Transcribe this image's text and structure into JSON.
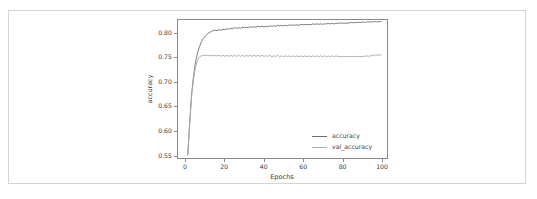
{
  "figure": {
    "background_color": "#ffffff",
    "frame_color": "#d4d4d4",
    "axes_color": "#8a8a8a",
    "text_color": "#3d3d3d"
  },
  "chart_data": {
    "type": "line",
    "title": "",
    "xlabel": "Epochs",
    "ylabel": "accuracy",
    "xlim": [
      -4,
      103
    ],
    "ylim": [
      0.543,
      0.828
    ],
    "grid": false,
    "legend_position": "lower right",
    "xticks": [
      0,
      20,
      40,
      60,
      80,
      100
    ],
    "xtick_labels": [
      "0",
      "20",
      "40",
      "60",
      "80",
      "100"
    ],
    "yticks": [
      0.55,
      0.6,
      0.65,
      0.7,
      0.75,
      0.8
    ],
    "ytick_labels": [
      "0.55",
      "0.60",
      "0.65",
      "0.70",
      "0.75",
      "0.80"
    ],
    "x": [
      1,
      2,
      3,
      4,
      5,
      6,
      7,
      8,
      9,
      10,
      11,
      12,
      13,
      14,
      15,
      16,
      17,
      18,
      19,
      20,
      21,
      22,
      23,
      24,
      25,
      26,
      27,
      28,
      29,
      30,
      31,
      32,
      33,
      34,
      35,
      36,
      37,
      38,
      39,
      40,
      41,
      42,
      43,
      44,
      45,
      46,
      47,
      48,
      49,
      50,
      51,
      52,
      53,
      54,
      55,
      56,
      57,
      58,
      59,
      60,
      61,
      62,
      63,
      64,
      65,
      66,
      67,
      68,
      69,
      70,
      71,
      72,
      73,
      74,
      75,
      76,
      77,
      78,
      79,
      80,
      81,
      82,
      83,
      84,
      85,
      86,
      87,
      88,
      89,
      90,
      91,
      92,
      93,
      94,
      95,
      96,
      97,
      98,
      99,
      100
    ],
    "series": [
      {
        "name": "accuracy",
        "color": "#6e6e6e",
        "values": [
          0.549,
          0.616,
          0.676,
          0.714,
          0.742,
          0.76,
          0.773,
          0.783,
          0.79,
          0.795,
          0.799,
          0.802,
          0.804,
          0.806,
          0.807,
          0.806,
          0.808,
          0.807,
          0.809,
          0.808,
          0.81,
          0.809,
          0.811,
          0.81,
          0.812,
          0.811,
          0.812,
          0.811,
          0.813,
          0.812,
          0.813,
          0.812,
          0.814,
          0.813,
          0.814,
          0.813,
          0.815,
          0.814,
          0.815,
          0.814,
          0.815,
          0.814,
          0.816,
          0.815,
          0.816,
          0.815,
          0.817,
          0.816,
          0.817,
          0.816,
          0.817,
          0.816,
          0.818,
          0.817,
          0.818,
          0.817,
          0.818,
          0.817,
          0.819,
          0.818,
          0.819,
          0.818,
          0.819,
          0.818,
          0.82,
          0.819,
          0.82,
          0.819,
          0.82,
          0.819,
          0.82,
          0.82,
          0.821,
          0.82,
          0.821,
          0.82,
          0.821,
          0.821,
          0.822,
          0.821,
          0.822,
          0.821,
          0.822,
          0.822,
          0.823,
          0.822,
          0.823,
          0.823,
          0.823,
          0.823,
          0.824,
          0.823,
          0.824,
          0.824,
          0.824,
          0.824,
          0.825,
          0.824,
          0.825,
          0.825
        ]
      },
      {
        "name": "val_accuracy",
        "color": "#a8a8a8",
        "values": [
          0.551,
          0.614,
          0.672,
          0.708,
          0.732,
          0.745,
          0.752,
          0.754,
          0.755,
          0.755,
          0.755,
          0.754,
          0.755,
          0.754,
          0.755,
          0.754,
          0.755,
          0.753,
          0.755,
          0.753,
          0.755,
          0.753,
          0.755,
          0.753,
          0.755,
          0.753,
          0.755,
          0.753,
          0.755,
          0.753,
          0.755,
          0.753,
          0.755,
          0.753,
          0.755,
          0.753,
          0.755,
          0.753,
          0.755,
          0.753,
          0.754,
          0.753,
          0.755,
          0.752,
          0.754,
          0.753,
          0.755,
          0.752,
          0.754,
          0.752,
          0.754,
          0.752,
          0.754,
          0.752,
          0.754,
          0.752,
          0.754,
          0.752,
          0.754,
          0.752,
          0.754,
          0.752,
          0.754,
          0.752,
          0.754,
          0.752,
          0.754,
          0.752,
          0.754,
          0.752,
          0.754,
          0.752,
          0.754,
          0.752,
          0.754,
          0.752,
          0.754,
          0.752,
          0.753,
          0.752,
          0.753,
          0.752,
          0.753,
          0.752,
          0.753,
          0.752,
          0.753,
          0.752,
          0.753,
          0.752,
          0.753,
          0.753,
          0.754,
          0.753,
          0.755,
          0.754,
          0.756,
          0.755,
          0.756,
          0.756
        ]
      }
    ]
  },
  "legend": {
    "items": [
      {
        "label": "accuracy",
        "color": "#6e6e6e"
      },
      {
        "label": "val_accuracy",
        "color": "#a8a8a8"
      }
    ]
  }
}
